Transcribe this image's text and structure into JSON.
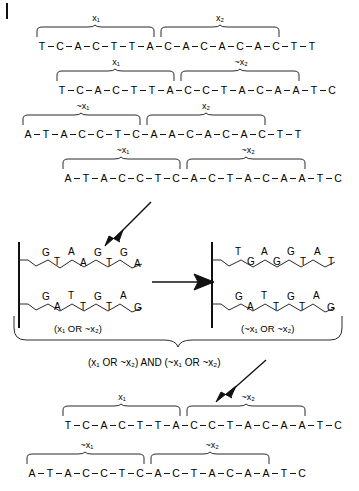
{
  "figure": {
    "ink_color": "#1a1a1a",
    "background": "#ffffff"
  },
  "corner_mark": {
    "name": "page-tick",
    "label": ""
  },
  "sequences": [
    {
      "id": "seq-1",
      "bases": [
        "T",
        "C",
        "A",
        "C",
        "T",
        "T",
        "A",
        "C",
        "A",
        "C",
        "A",
        "C",
        "A",
        "C",
        "T",
        "T"
      ],
      "segments": [
        {
          "label": "x",
          "sub": "1",
          "negated": false,
          "start": 0,
          "end": 7
        },
        {
          "label": "x",
          "sub": "2",
          "negated": false,
          "start": 8,
          "end": 15
        }
      ]
    },
    {
      "id": "seq-2",
      "bases": [
        "T",
        "C",
        "A",
        "C",
        "T",
        "T",
        "A",
        "C",
        "C",
        "T",
        "A",
        "C",
        "A",
        "A",
        "T",
        "C"
      ],
      "segments": [
        {
          "label": "x",
          "sub": "1",
          "negated": false,
          "start": 0,
          "end": 7
        },
        {
          "label": "x",
          "sub": "2",
          "negated": true,
          "start": 8,
          "end": 15
        }
      ]
    },
    {
      "id": "seq-3",
      "bases": [
        "A",
        "T",
        "A",
        "C",
        "C",
        "T",
        "C",
        "A",
        "A",
        "C",
        "A",
        "C",
        "A",
        "C",
        "T",
        "T"
      ],
      "segments": [
        {
          "label": "x",
          "sub": "1",
          "negated": true,
          "start": 0,
          "end": 7
        },
        {
          "label": "x",
          "sub": "2",
          "negated": false,
          "start": 8,
          "end": 15
        }
      ]
    },
    {
      "id": "seq-4",
      "bases": [
        "A",
        "T",
        "A",
        "C",
        "C",
        "T",
        "C",
        "A",
        "C",
        "T",
        "A",
        "C",
        "A",
        "A",
        "T",
        "C"
      ],
      "segments": [
        {
          "label": "x",
          "sub": "1",
          "negated": true,
          "start": 0,
          "end": 7
        },
        {
          "label": "x",
          "sub": "2",
          "negated": true,
          "start": 8,
          "end": 15
        }
      ]
    },
    {
      "id": "seq-5",
      "bases": [
        "T",
        "C",
        "A",
        "C",
        "T",
        "T",
        "A",
        "C",
        "C",
        "T",
        "A",
        "C",
        "A",
        "A",
        "T",
        "C"
      ],
      "segments": [
        {
          "label": "x",
          "sub": "1",
          "negated": false,
          "start": 0,
          "end": 7
        },
        {
          "label": "x",
          "sub": "2",
          "negated": true,
          "start": 8,
          "end": 15
        }
      ]
    },
    {
      "id": "seq-6",
      "bases": [
        "A",
        "T",
        "A",
        "C",
        "C",
        "T",
        "C",
        "A",
        "C",
        "T",
        "A",
        "C",
        "A",
        "A",
        "T",
        "C"
      ],
      "segments": [
        {
          "label": "x",
          "sub": "1",
          "negated": true,
          "start": 0,
          "end": 7
        },
        {
          "label": "x",
          "sub": "2",
          "negated": true,
          "start": 8,
          "end": 15
        }
      ]
    }
  ],
  "clause_boxes": [
    {
      "id": "clause-left",
      "caption": "(x₁ OR ~x₂)",
      "top_strand": [
        "G",
        "T",
        "A",
        "A",
        "G",
        "T",
        "G",
        "A"
      ],
      "bottom_strand": [
        "G",
        "A",
        "T",
        "T",
        "G",
        "T",
        "A",
        "G"
      ]
    },
    {
      "id": "clause-right",
      "caption": "(~x₁ OR ~x₂)",
      "top_strand": [
        "T",
        "G",
        "A",
        "G",
        "G",
        "T",
        "A",
        "T"
      ],
      "bottom_strand": [
        "G",
        "A",
        "T",
        "T",
        "G",
        "T",
        "A",
        "G"
      ]
    }
  ],
  "combined_formula": "(x₁ OR ~x₂) AND (~x₁ OR ~x₂)",
  "arrows": [
    {
      "id": "arrow-to-clauses",
      "direction": "down-left",
      "name": "arrow-down-left"
    },
    {
      "id": "arrow-between-boxes",
      "direction": "right",
      "name": "arrow-right"
    },
    {
      "id": "arrow-to-results",
      "direction": "down-left",
      "name": "arrow-down-left"
    }
  ],
  "labels": {
    "x1": "x₁",
    "x2": "x₂",
    "not_x1": "~x₁",
    "not_x2": "~x₂"
  }
}
